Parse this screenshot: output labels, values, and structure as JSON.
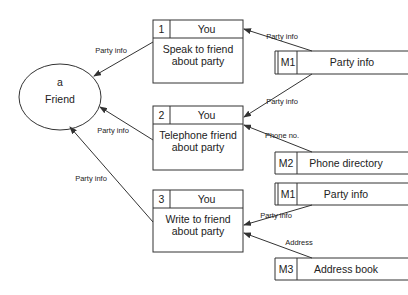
{
  "entity": {
    "id": "a",
    "label": "Friend"
  },
  "processes": [
    {
      "number": "1",
      "actor": "You",
      "line1": "Speak to friend",
      "line2": "about party"
    },
    {
      "number": "2",
      "actor": "You",
      "line1": "Telephone friend",
      "line2": "about party"
    },
    {
      "number": "3",
      "actor": "You",
      "line1": "Write to friend",
      "line2": "about party"
    }
  ],
  "data_stores": [
    {
      "id": "M1",
      "label": "Party info"
    },
    {
      "id": "M2",
      "label": "Phone directory"
    },
    {
      "id": "M1",
      "label": "Party info"
    },
    {
      "id": "M3",
      "label": "Address book"
    }
  ],
  "flows": [
    {
      "label": "Party info",
      "from": "M1",
      "to": "1"
    },
    {
      "label": "Party info",
      "from": "1",
      "to": "a"
    },
    {
      "label": "Party info",
      "from": "M1",
      "to": "2"
    },
    {
      "label": "Phone no.",
      "from": "M2",
      "to": "2"
    },
    {
      "label": "Party info",
      "from": "2",
      "to": "a"
    },
    {
      "label": "Party info",
      "from": "3",
      "to": "a"
    },
    {
      "label": "Party info",
      "from": "M1",
      "to": "3"
    },
    {
      "label": "Address",
      "from": "M3",
      "to": "3"
    }
  ]
}
